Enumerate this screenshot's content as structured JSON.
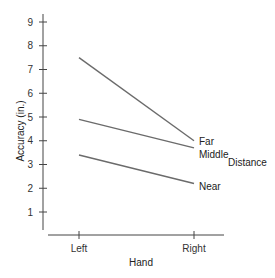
{
  "chart_data": {
    "type": "line",
    "title": "",
    "xlabel": "Hand",
    "ylabel": "Accuracy (in.)",
    "legend_title": "Distance",
    "categories": [
      "Left",
      "Right"
    ],
    "ylim": [
      0,
      9
    ],
    "yticks": [
      1,
      2,
      3,
      4,
      5,
      6,
      7,
      8,
      9
    ],
    "grid": false,
    "legend_position": "right, inline labels at line ends",
    "series": [
      {
        "name": "Far",
        "values": [
          7.5,
          4.0
        ]
      },
      {
        "name": "Middle",
        "values": [
          4.9,
          3.7
        ]
      },
      {
        "name": "Near",
        "values": [
          3.4,
          2.2
        ]
      }
    ],
    "colors": {
      "line": "#6b6b6b",
      "axis": "#444444",
      "text": "#222222"
    }
  }
}
